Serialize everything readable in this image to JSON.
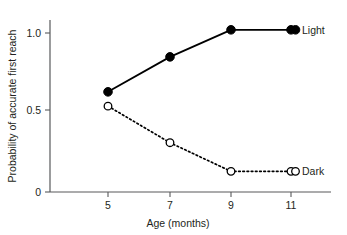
{
  "chart_data": {
    "type": "line",
    "title": "",
    "xlabel": "Age (months)",
    "ylabel": "Probability of accurate first reach",
    "x": [
      5,
      7,
      9,
      11
    ],
    "xticklabels": [
      "5",
      "7",
      "9",
      "11"
    ],
    "yticklabels": [
      "0",
      "0.5",
      "1.0"
    ],
    "ytickvalues": [
      0,
      0.5,
      1.0
    ],
    "xlim": [
      4,
      12.4
    ],
    "ylim": [
      0,
      1.1
    ],
    "grid": false,
    "legend_position": "inline-right-of-last-point",
    "series": [
      {
        "name": "Light",
        "values": [
          0.63,
          0.85,
          1.02,
          1.02
        ],
        "marker": "filled-circle",
        "linestyle": "solid",
        "color": "#000000",
        "label": "Light"
      },
      {
        "name": "Dark",
        "values": [
          0.54,
          0.31,
          0.13,
          0.13
        ],
        "marker": "open-circle",
        "linestyle": "dotted",
        "color": "#000000",
        "label": "Dark"
      }
    ]
  },
  "axes": {
    "y_title": "Probability of accurate first reach",
    "x_title": "Age (months)",
    "y_ticks": [
      {
        "label": "1.0"
      },
      {
        "label": "0.5"
      },
      {
        "label": "0"
      }
    ],
    "x_ticks": [
      {
        "label": "5"
      },
      {
        "label": "7"
      },
      {
        "label": "9"
      },
      {
        "label": "11"
      }
    ]
  },
  "legend": {
    "light_label": "Light",
    "dark_label": "Dark"
  },
  "colors": {
    "ink": "#231f20",
    "axis": "#58595b",
    "series": "#000000",
    "background": "#ffffff"
  }
}
